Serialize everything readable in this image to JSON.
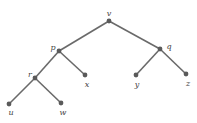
{
  "diagram": {
    "type": "binary-tree",
    "colors": {
      "edge": "#6a6a6a",
      "node": "#5a5a5a",
      "label": "#444444",
      "background": "#ffffff"
    },
    "nodes": [
      {
        "id": "v",
        "label": "v",
        "x": 109,
        "y": 21,
        "lx": 109,
        "ly": 14
      },
      {
        "id": "p",
        "label": "p",
        "x": 59,
        "y": 51,
        "lx": 53,
        "ly": 48
      },
      {
        "id": "q",
        "label": "q",
        "x": 160,
        "y": 49,
        "lx": 169,
        "ly": 47
      },
      {
        "id": "r",
        "label": "r",
        "x": 35,
        "y": 78,
        "lx": 30,
        "ly": 75
      },
      {
        "id": "x",
        "label": "x",
        "x": 85,
        "y": 75,
        "lx": 87,
        "ly": 85
      },
      {
        "id": "y",
        "label": "y",
        "x": 136,
        "y": 75,
        "lx": 137,
        "ly": 85
      },
      {
        "id": "z",
        "label": "z",
        "x": 186,
        "y": 74,
        "lx": 188,
        "ly": 84
      },
      {
        "id": "u",
        "label": "u",
        "x": 9,
        "y": 104,
        "lx": 11,
        "ly": 113
      },
      {
        "id": "w",
        "label": "w",
        "x": 61,
        "y": 103,
        "lx": 63,
        "ly": 113
      }
    ],
    "edges": [
      [
        "v",
        "p"
      ],
      [
        "v",
        "q"
      ],
      [
        "p",
        "r"
      ],
      [
        "p",
        "x"
      ],
      [
        "q",
        "y"
      ],
      [
        "q",
        "z"
      ],
      [
        "r",
        "u"
      ],
      [
        "r",
        "w"
      ]
    ]
  }
}
